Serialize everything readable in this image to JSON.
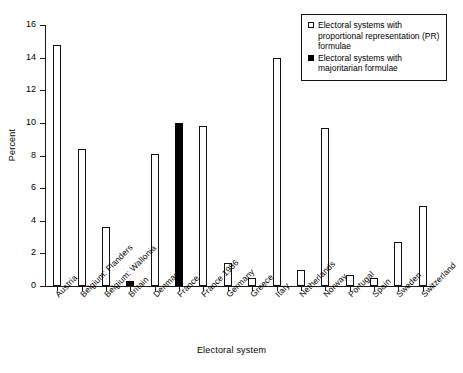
{
  "chart_data": {
    "type": "bar",
    "title": "",
    "xlabel": "Electoral system",
    "ylabel": "Percent",
    "ylim": [
      0,
      16
    ],
    "ytick_labels": [
      "0",
      "2",
      "4",
      "6",
      "8",
      "10",
      "12",
      "14",
      "16"
    ],
    "ytick_values": [
      0,
      2,
      4,
      6,
      8,
      10,
      12,
      14,
      16
    ],
    "grid": false,
    "legend_position": "top-right",
    "categories": [
      "Austria",
      "Belgium: Flanders",
      "Belgium: Wallonia",
      "Britain",
      "Denmark",
      "France",
      "France 1986",
      "Germany",
      "Greece",
      "Italy",
      "Netherlands",
      "Norway",
      "Portugal",
      "Spain",
      "Sweden",
      "Switzerland"
    ],
    "values": [
      14.8,
      8.4,
      3.6,
      0.3,
      8.1,
      10.0,
      9.8,
      1.4,
      0.5,
      14.0,
      1.0,
      9.7,
      0.7,
      0.5,
      2.7,
      4.9
    ],
    "series_of_point": [
      "pr",
      "pr",
      "pr",
      "maj",
      "pr",
      "maj",
      "pr",
      "pr",
      "pr",
      "pr",
      "pr",
      "pr",
      "pr",
      "pr",
      "pr",
      "pr"
    ],
    "series": [
      {
        "name": "Electoral systems with proportional representation (PR) formulae",
        "key": "pr",
        "color": "#ffffff",
        "edge_color": "#111111"
      },
      {
        "name": "Electoral systems with majoritarian formulae",
        "key": "maj",
        "color": "#000000",
        "edge_color": "#000000"
      }
    ]
  },
  "legend": {
    "entries": [
      {
        "key": "pr",
        "label": "Electoral systems with proportional representation (PR) formulae"
      },
      {
        "key": "maj",
        "label": "Electoral systems with majoritarian formulae"
      }
    ]
  }
}
